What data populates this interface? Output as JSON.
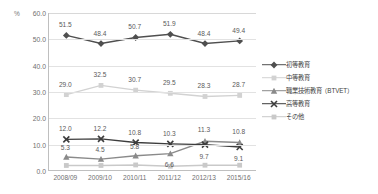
{
  "chart_data": {
    "type": "line",
    "title": "",
    "xlabel": "",
    "ylabel": "%",
    "unit_label": "%",
    "ylim": [
      0.0,
      60.0
    ],
    "ytick_step": 10.0,
    "yticks": [
      "0.0",
      "10.0",
      "20.0",
      "30.0",
      "40.0",
      "50.0",
      "60.0"
    ],
    "grid": true,
    "legend_position": "right",
    "categories": [
      "2008/09",
      "2009/10",
      "2010/11",
      "2011/12",
      "2012/13",
      "2015/16"
    ],
    "series": [
      {
        "name": "初等教育",
        "color": "#4f4f4f",
        "marker": "diamond",
        "values": [
          51.5,
          48.4,
          50.7,
          51.9,
          48.4,
          49.4
        ],
        "labels": [
          "51.5",
          "48.4",
          "50.7",
          "51.9",
          "48.4",
          "49.4"
        ],
        "label_offsets": [
          -11,
          -11,
          -11,
          -11,
          -11,
          -11
        ]
      },
      {
        "name": "中等教育",
        "color": "#d2d2d2",
        "marker": "square",
        "values": [
          29.0,
          32.5,
          30.7,
          29.5,
          28.3,
          28.7
        ],
        "labels": [
          "29.0",
          "32.5",
          "30.7",
          "29.5",
          "28.3",
          "28.7"
        ],
        "label_offsets": [
          -11,
          -11,
          -11,
          -11,
          -11,
          -11
        ]
      },
      {
        "name": "職業技術教育（BTVET）",
        "color": "#8a8a8a",
        "marker": "triangle",
        "values": [
          5.3,
          4.5,
          5.8,
          6.6,
          11.3,
          10.8
        ],
        "labels": [
          "5.3",
          "4.5",
          "5.8",
          "6.6",
          "11.3",
          "10.8"
        ],
        "label_offsets": [
          -10,
          -10,
          -10,
          10,
          -12,
          -12
        ]
      },
      {
        "name": "高等教育",
        "color": "#3d3d3d",
        "marker": "cross",
        "values": [
          12.0,
          12.2,
          10.8,
          10.3,
          10.0,
          9.1
        ],
        "labels": [
          "12.0",
          "12.2",
          "10.8",
          "10.3",
          "9.7",
          "9.1"
        ],
        "label_offsets": [
          -11,
          -11,
          -11,
          -11,
          11,
          11
        ]
      },
      {
        "name": "その他",
        "color": "#c9c9c9",
        "marker": "square",
        "values": [
          2.1,
          2.1,
          2.3,
          1.8,
          2.2,
          2.2
        ],
        "labels": [
          "",
          "",
          "",
          "",
          "",
          ""
        ],
        "label_offsets": [
          0,
          0,
          0,
          0,
          0,
          0
        ]
      }
    ]
  }
}
